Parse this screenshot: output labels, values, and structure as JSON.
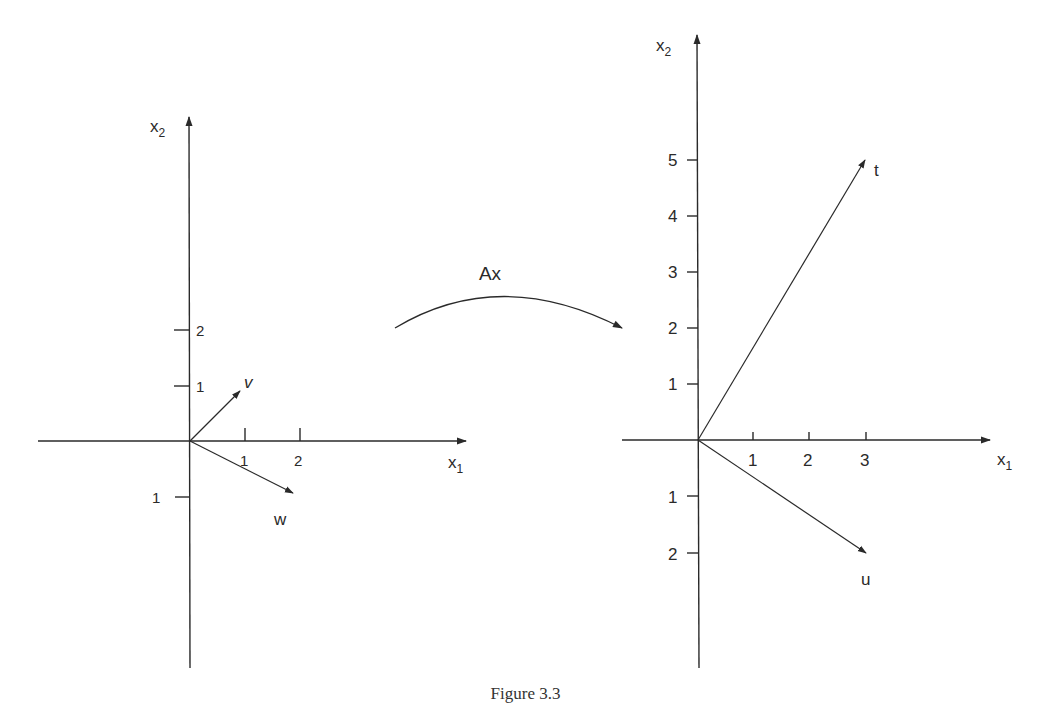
{
  "figure": {
    "caption": "Figure 3.3",
    "transform_label": "Ax"
  },
  "left_plot": {
    "x_axis_label": "x",
    "x_axis_sub": "1",
    "y_axis_label": "x",
    "y_axis_sub": "2",
    "x_ticks": [
      "1",
      "2"
    ],
    "y_ticks_pos": [
      "1",
      "2"
    ],
    "y_ticks_neg": [
      "1"
    ],
    "vectors": [
      {
        "name": "v",
        "x": 1,
        "y": 1
      },
      {
        "name": "w",
        "x": 2,
        "y": -1
      }
    ]
  },
  "right_plot": {
    "x_axis_label": "x",
    "x_axis_sub": "1",
    "y_axis_label": "x",
    "y_axis_sub": "2",
    "x_ticks": [
      "1",
      "2",
      "3"
    ],
    "y_ticks_pos": [
      "1",
      "2",
      "3",
      "4",
      "5"
    ],
    "y_ticks_neg": [
      "1",
      "2"
    ],
    "vectors": [
      {
        "name": "t",
        "x": 3,
        "y": 5
      },
      {
        "name": "u",
        "x": 3,
        "y": -2
      }
    ]
  },
  "colors": {
    "ink": "#2a2a2a",
    "background": "#ffffff"
  }
}
